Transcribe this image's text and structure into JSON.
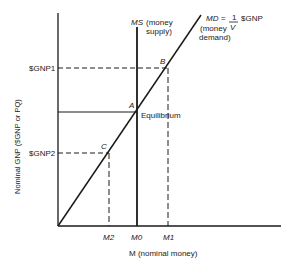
{
  "diagram": {
    "type": "money-market",
    "y_axis_label": "Nominal GNP ($GNP or PQ)",
    "x_axis_label": "M (nominal money)",
    "y_ticks": [
      "$GNP1",
      "$GNP2"
    ],
    "x_ticks": [
      "M2",
      "M0",
      "M1"
    ],
    "ms_label_line1": "MS",
    "ms_label_line2": "(money",
    "ms_label_line3": "supply)",
    "md_label": "MD =",
    "md_fraction_num": "1",
    "md_fraction_den": "V",
    "md_label_tail": "$GNP",
    "md_sub1": "(money",
    "md_sub2": "demand)",
    "points": {
      "A": "A",
      "B": "B",
      "C": "C"
    },
    "equilibrium_label": "Equilibrium"
  }
}
